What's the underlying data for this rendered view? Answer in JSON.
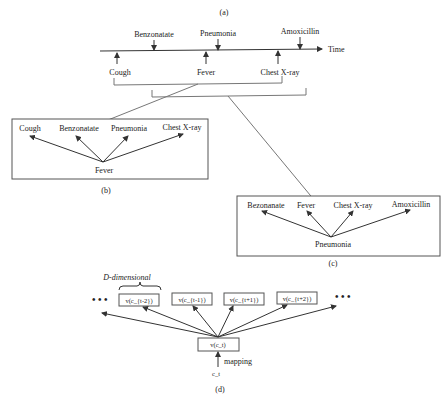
{
  "panel_a": {
    "caption": "(a)",
    "axis_label": "Time",
    "events_above": [
      "Benzonatate",
      "Pneumonia",
      "Amoxicillin"
    ],
    "events_below": [
      "Cough",
      "Fever",
      "Chest X-ray"
    ]
  },
  "panel_b": {
    "caption": "(b)",
    "center": "Fever",
    "context": [
      "Cough",
      "Benzonatate",
      "Pneumonia",
      "Chest X-ray"
    ]
  },
  "panel_c": {
    "caption": "(c)",
    "center": "Pneumonia",
    "context": [
      "Bezonanate",
      "Fever",
      "Chest X-ray",
      "Amoxicillin"
    ]
  },
  "panel_d": {
    "caption": "(d)",
    "dimension_label": "D-dimensional",
    "ellipsis": "• • •",
    "context_vectors": [
      "v(c_{t-2})",
      "v(c_{t-1})",
      "v(c_{t+1})",
      "v(c_{t+2})"
    ],
    "center_vector": "v(c_t)",
    "mapping_label": "mapping",
    "input_code": "c_t"
  }
}
